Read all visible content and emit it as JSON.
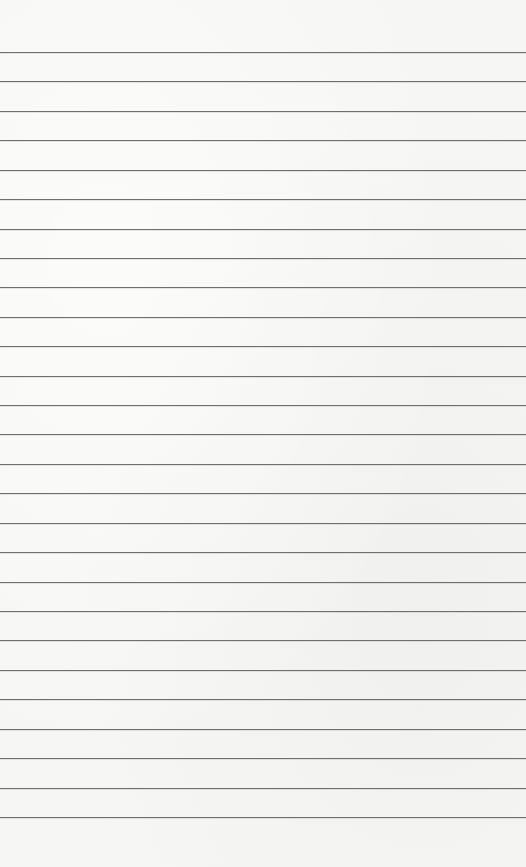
{
  "page": {
    "title": "",
    "kind": "lined-paper",
    "rule_count": 27,
    "paper_color": "#f6f6f4",
    "rule_color": "#6f6f6f"
  }
}
